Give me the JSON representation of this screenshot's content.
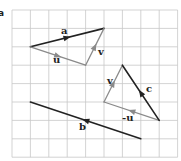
{
  "figure": {
    "part_label": "a",
    "grid": {
      "x0": 12,
      "y0": 10,
      "cell": 18.4,
      "cols": 9,
      "rows": 8,
      "color": "#c8c8c8"
    },
    "colors": {
      "dark": "#222222",
      "light": "#8a8a8a"
    },
    "vectors": [
      {
        "name": "a",
        "label": "a",
        "from": [
          1,
          2
        ],
        "to": [
          5,
          1
        ],
        "style": "dark",
        "label_pos": [
          61,
          34
        ]
      },
      {
        "name": "u",
        "label": "u",
        "from": [
          1,
          2
        ],
        "to": [
          4,
          3
        ],
        "style": "light",
        "label_pos": [
          53,
          63
        ]
      },
      {
        "name": "v",
        "label": "v",
        "from": [
          4,
          3
        ],
        "to": [
          5,
          1
        ],
        "style": "light",
        "label_pos": [
          98,
          55
        ]
      },
      {
        "name": "v2",
        "label": "v",
        "from": [
          5,
          5
        ],
        "to": [
          6,
          3
        ],
        "style": "light",
        "label_pos": [
          107,
          84
        ]
      },
      {
        "name": "neg-u",
        "label": "-u",
        "from": [
          8,
          6
        ],
        "to": [
          5,
          5
        ],
        "style": "light",
        "label_pos": [
          122,
          121
        ]
      },
      {
        "name": "c",
        "label": "c",
        "from": [
          8,
          6
        ],
        "to": [
          6,
          3
        ],
        "style": "dark",
        "label_pos": [
          146,
          92
        ]
      },
      {
        "name": "b",
        "label": "b",
        "from": [
          7,
          7
        ],
        "to": [
          1,
          5
        ],
        "style": "dark",
        "label_pos": [
          79,
          130
        ]
      }
    ]
  }
}
